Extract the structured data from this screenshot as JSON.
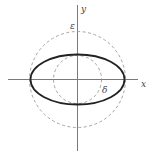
{
  "diagram": {
    "type": "geometric-figure",
    "labels": {
      "x_axis": "x",
      "y_axis": "y",
      "epsilon": "ε",
      "delta": "δ"
    },
    "colors": {
      "axes": "#7a7a7a",
      "ellipse": "#222222",
      "dashed_circles": "#9a9a9a",
      "text": "#444444"
    },
    "shapes": {
      "outer_dashed_circle": {
        "cx": 77.5,
        "cy": 79.5,
        "r": 48
      },
      "inner_dashed_circle": {
        "cx": 77.5,
        "cy": 79.5,
        "r": 24
      },
      "ellipse": {
        "cx": 77.5,
        "cy": 79.5,
        "rx": 47,
        "ry": 25
      }
    }
  }
}
